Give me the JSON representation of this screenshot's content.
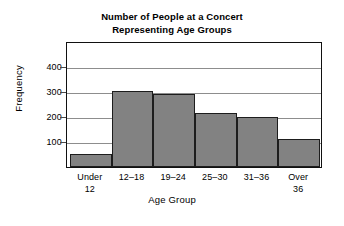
{
  "chart_data": {
    "type": "bar",
    "title": "Number of People at a Concert Representing Age Groups",
    "title_lines": [
      "Number of People at a Concert",
      "Representing Age Groups"
    ],
    "categories": [
      "Under 12",
      "12–18",
      "19–24",
      "25–30",
      "31–36",
      "Over 36"
    ],
    "category_lines": [
      [
        "Under",
        "12"
      ],
      [
        "12–18",
        ""
      ],
      [
        "19–24",
        ""
      ],
      [
        "25–30",
        ""
      ],
      [
        "31–36",
        ""
      ],
      [
        "Over",
        "36"
      ]
    ],
    "values": [
      52,
      300,
      290,
      215,
      200,
      110
    ],
    "xlabel": "Age Group",
    "ylabel": "Frequency",
    "ylim": [
      0,
      500
    ],
    "yticks": [
      100,
      200,
      300,
      400
    ],
    "ytick_labels": [
      "100",
      "200",
      "300",
      "400"
    ],
    "grid": true,
    "legend": null,
    "bar_color": "#828282",
    "bar_edge_color": "#1d1d1d",
    "grid_color": "#8d8d8d",
    "axis_color": "#111111",
    "background": "#ffffff"
  }
}
